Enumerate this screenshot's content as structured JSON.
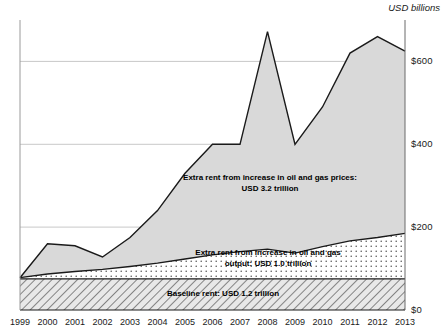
{
  "units_label": "USD billions",
  "axis": {
    "y_ticks": [
      "$0",
      "$200",
      "$400",
      "$600"
    ],
    "y_tick_values": [
      0,
      200,
      400,
      600
    ],
    "x_ticks": [
      "1999",
      "2000",
      "2001",
      "2002",
      "2003",
      "2004",
      "2005",
      "2006",
      "2007",
      "2008",
      "2009",
      "2010",
      "2011",
      "2012",
      "2013"
    ]
  },
  "annotations": {
    "prices_line1": "Extra rent from increase in oil and gas prices:",
    "prices_line2": "USD 3.2 trillion",
    "output_line1": "Extra rent from increase in oil and gas",
    "output_line2": "output: USD 1.0 trillion",
    "baseline_line1": "Baseline rent: USD 1.2 trillion"
  },
  "colors": {
    "price_band_fill": "#d9d9d9",
    "price_band_stroke": "#000000",
    "output_band_fill": "#ffffff",
    "output_band_stroke": "#000000",
    "baseline_band_fill": "#d0d0d0",
    "baseline_band_stroke": "#000000",
    "gridline": "#c8c8c8",
    "text": "#1a1a1a"
  },
  "chart_data": {
    "type": "area",
    "stacked": true,
    "title": "",
    "subtitle": "",
    "xlabel": "",
    "ylabel": "USD billions",
    "ylim": [
      0,
      700
    ],
    "grid": true,
    "legend": "inline-annotations",
    "x": [
      1999,
      2000,
      2001,
      2002,
      2003,
      2004,
      2005,
      2006,
      2007,
      2008,
      2009,
      2010,
      2011,
      2012,
      2013
    ],
    "series": [
      {
        "name": "Baseline rent",
        "total_label": "USD 1.2 trillion",
        "fill": "hatch",
        "values": [
          75,
          75,
          75,
          75,
          75,
          75,
          75,
          75,
          75,
          75,
          75,
          75,
          75,
          75,
          75
        ]
      },
      {
        "name": "Extra rent from increase in oil and gas output",
        "total_label": "USD 1.0 trillion",
        "fill": "dots",
        "values": [
          3,
          12,
          18,
          23,
          30,
          38,
          48,
          58,
          66,
          72,
          62,
          78,
          92,
          100,
          110
        ]
      },
      {
        "name": "Extra rent from increase in oil and gas prices",
        "total_label": "USD 3.2 trillion",
        "fill": "solid-gray",
        "values": [
          0,
          73,
          62,
          30,
          70,
          127,
          207,
          267,
          259,
          525,
          263,
          337,
          453,
          485,
          440
        ]
      }
    ],
    "cumulative_totals": [
      78,
      160,
      155,
      128,
      175,
      240,
      330,
      400,
      400,
      672,
      400,
      490,
      620,
      660,
      625
    ]
  }
}
